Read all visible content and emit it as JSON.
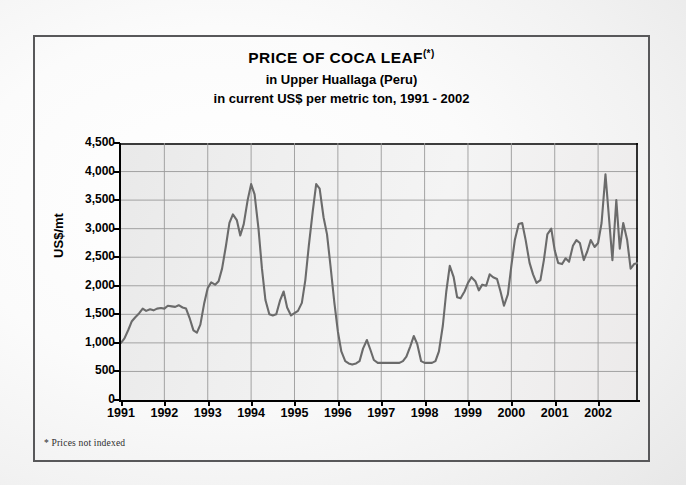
{
  "title": {
    "line1": "PRICE OF COCA LEAF",
    "line1_footnote_marker": "(*)",
    "line2": "in Upper Huallaga (Peru)",
    "line3": "in current  US$ per metric ton, 1991 - 2002"
  },
  "footnote": "* Prices not indexed",
  "axes": {
    "y_title": "US$/mt",
    "y_ticks": [
      "0",
      "500",
      "1,000",
      "1,500",
      "2,000",
      "2,500",
      "3,000",
      "3,500",
      "4,000",
      "4,500"
    ],
    "x_ticks": [
      "1991",
      "1992",
      "1993",
      "1994",
      "1995",
      "1996",
      "1997",
      "1998",
      "1999",
      "2000",
      "2001",
      "2002"
    ]
  },
  "colors": {
    "line": "#6b6b6b",
    "grid": "#9a9a9a",
    "axis": "#000000",
    "frame": "#58585a",
    "plot_background": "#eeeeee"
  },
  "chart_data": {
    "type": "line",
    "xlabel": "",
    "ylabel": "US$/mt",
    "xlim": [
      1991,
      2002.92
    ],
    "ylim": [
      0,
      4500
    ],
    "ytick_values": [
      0,
      500,
      1000,
      1500,
      2000,
      2500,
      3000,
      3500,
      4000,
      4500
    ],
    "xtick_values": [
      1991,
      1992,
      1993,
      1994,
      1995,
      1996,
      1997,
      1998,
      1999,
      2000,
      2001,
      2002
    ],
    "grid": true,
    "legend": false,
    "series": [
      {
        "name": "Coca leaf price, Upper Huallaga",
        "x": [
          1991.0,
          1991.08,
          1991.17,
          1991.25,
          1991.33,
          1991.42,
          1991.5,
          1991.58,
          1991.67,
          1991.75,
          1991.83,
          1991.92,
          1992.0,
          1992.08,
          1992.17,
          1992.25,
          1992.33,
          1992.42,
          1992.5,
          1992.58,
          1992.67,
          1992.75,
          1992.83,
          1992.92,
          1993.0,
          1993.08,
          1993.17,
          1993.25,
          1993.33,
          1993.42,
          1993.5,
          1993.58,
          1993.67,
          1993.75,
          1993.83,
          1993.92,
          1994.0,
          1994.08,
          1994.17,
          1994.25,
          1994.33,
          1994.42,
          1994.5,
          1994.58,
          1994.67,
          1994.75,
          1994.83,
          1994.92,
          1995.0,
          1995.08,
          1995.17,
          1995.25,
          1995.33,
          1995.42,
          1995.5,
          1995.58,
          1995.67,
          1995.75,
          1995.83,
          1995.92,
          1996.0,
          1996.08,
          1996.17,
          1996.25,
          1996.33,
          1996.42,
          1996.5,
          1996.58,
          1996.67,
          1996.75,
          1996.83,
          1996.92,
          1997.0,
          1997.08,
          1997.17,
          1997.25,
          1997.33,
          1997.42,
          1997.5,
          1997.58,
          1997.67,
          1997.75,
          1997.83,
          1997.92,
          1998.0,
          1998.08,
          1998.17,
          1998.25,
          1998.33,
          1998.42,
          1998.5,
          1998.58,
          1998.67,
          1998.75,
          1998.83,
          1998.92,
          1999.0,
          1999.08,
          1999.17,
          1999.25,
          1999.33,
          1999.42,
          1999.5,
          1999.58,
          1999.67,
          1999.75,
          1999.83,
          1999.92,
          2000.0,
          2000.08,
          2000.17,
          2000.25,
          2000.33,
          2000.42,
          2000.5,
          2000.58,
          2000.67,
          2000.75,
          2000.83,
          2000.92,
          2001.0,
          2001.08,
          2001.17,
          2001.25,
          2001.33,
          2001.42,
          2001.5,
          2001.58,
          2001.67,
          2001.75,
          2001.83,
          2001.92,
          2002.0,
          2002.08,
          2002.17,
          2002.25,
          2002.33,
          2002.42,
          2002.5,
          2002.58,
          2002.67,
          2002.75,
          2002.83,
          2002.92
        ],
        "y": [
          1000,
          1080,
          1230,
          1380,
          1450,
          1520,
          1600,
          1560,
          1590,
          1570,
          1600,
          1610,
          1600,
          1650,
          1640,
          1630,
          1660,
          1620,
          1600,
          1440,
          1220,
          1180,
          1320,
          1700,
          1960,
          2060,
          2020,
          2080,
          2300,
          2700,
          3100,
          3250,
          3150,
          2880,
          3080,
          3500,
          3780,
          3600,
          3000,
          2300,
          1750,
          1500,
          1480,
          1500,
          1750,
          1900,
          1620,
          1480,
          1520,
          1560,
          1700,
          2100,
          2700,
          3300,
          3780,
          3700,
          3200,
          2900,
          2350,
          1700,
          1200,
          850,
          680,
          640,
          620,
          640,
          680,
          900,
          1050,
          880,
          700,
          650,
          650,
          650,
          650,
          650,
          650,
          650,
          680,
          760,
          940,
          1120,
          980,
          680,
          650,
          650,
          650,
          680,
          850,
          1300,
          1900,
          2350,
          2150,
          1800,
          1780,
          1900,
          2050,
          2150,
          2080,
          1920,
          2020,
          2000,
          2200,
          2150,
          2120,
          1900,
          1650,
          1850,
          2350,
          2800,
          3080,
          3100,
          2800,
          2400,
          2200,
          2050,
          2100,
          2450,
          2900,
          3000,
          2620,
          2400,
          2380,
          2480,
          2420,
          2700,
          2800,
          2750,
          2450,
          2600,
          2800,
          2680,
          2750,
          3100,
          3950,
          3200,
          2450,
          3500,
          2650,
          3100,
          2800,
          2300,
          2380,
          2400
        ]
      }
    ]
  }
}
